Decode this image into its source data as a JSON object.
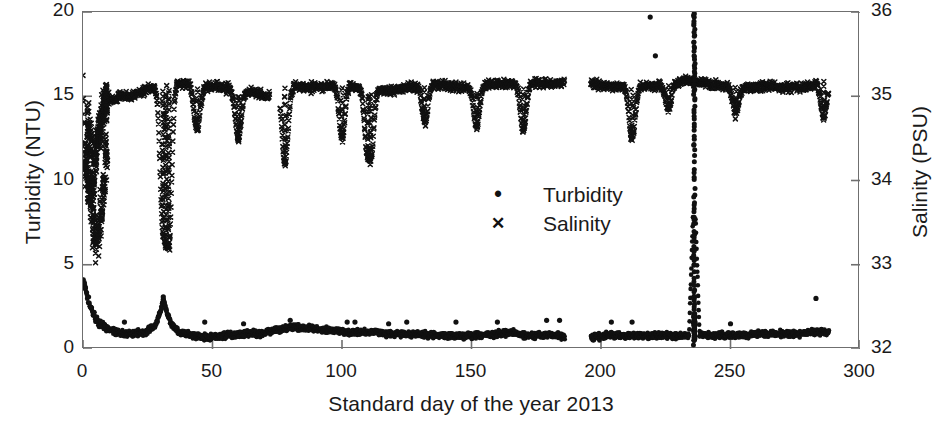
{
  "chart_data": {
    "type": "scatter",
    "title": "",
    "xlabel": "Standard  day of the  year 2013",
    "ylabel": "Turbidity (NTU)",
    "y2label": "Salinity (PSU)",
    "xlim": [
      0,
      300
    ],
    "ylim": [
      0,
      20
    ],
    "y2lim": [
      32,
      36
    ],
    "xticks": [
      "0",
      "50",
      "100",
      "150",
      "200",
      "250",
      "300"
    ],
    "xtick_values": [
      0,
      50,
      100,
      150,
      200,
      250,
      300
    ],
    "yticks": [
      "0",
      "5",
      "10",
      "15",
      "20"
    ],
    "ytick_values": [
      0,
      5,
      10,
      15,
      20
    ],
    "y2ticks": [
      "32",
      "33",
      "34",
      "35",
      "36"
    ],
    "y2tick_values": [
      32,
      33,
      34,
      35,
      36
    ],
    "grid": false,
    "frame": "box",
    "legend_position": "center",
    "marker_color": "#111111",
    "axis_color": "#6f6f6f",
    "background": "#ffffff",
    "series": [
      {
        "name": "Turbidity",
        "axis": "left",
        "marker": "dot",
        "units": "NTU",
        "description": "Dense near-baseline record 0.4-1.8 NTU across the year with an initial decay from ~4 NTU over days 0-8, a broad bump to ~3 NTU near day 31, scattered isolated points to ~1.5-2.5 NTU, a data gap at days 186-196, and a dramatic vertical excursion at day 236 spanning the full 0-20 NTU range.",
        "baseline_mean": 1.0,
        "peak_value": 20.0,
        "peak_day": 236,
        "gaps": [
          [
            186,
            196
          ]
        ],
        "data_start_day": 0,
        "data_end_day": 288,
        "anchors": [
          [
            0,
            3.9
          ],
          [
            1,
            3.6
          ],
          [
            2,
            3.0
          ],
          [
            3,
            2.5
          ],
          [
            4,
            2.1
          ],
          [
            5,
            1.8
          ],
          [
            6,
            1.6
          ],
          [
            8,
            1.4
          ],
          [
            10,
            1.2
          ],
          [
            13,
            1.0
          ],
          [
            16,
            0.9
          ],
          [
            20,
            0.9
          ],
          [
            24,
            1.0
          ],
          [
            28,
            1.4
          ],
          [
            30,
            2.3
          ],
          [
            31,
            3.0
          ],
          [
            32,
            2.4
          ],
          [
            34,
            1.5
          ],
          [
            37,
            1.0
          ],
          [
            42,
            0.8
          ],
          [
            48,
            0.7
          ],
          [
            55,
            0.8
          ],
          [
            62,
            0.9
          ],
          [
            68,
            0.9
          ],
          [
            74,
            1.1
          ],
          [
            80,
            1.3
          ],
          [
            88,
            1.2
          ],
          [
            96,
            1.1
          ],
          [
            104,
            1.0
          ],
          [
            112,
            1.0
          ],
          [
            120,
            0.9
          ],
          [
            128,
            0.9
          ],
          [
            136,
            0.8
          ],
          [
            144,
            0.8
          ],
          [
            152,
            0.8
          ],
          [
            160,
            0.9
          ],
          [
            166,
            1.0
          ],
          [
            170,
            0.8
          ],
          [
            176,
            0.8
          ],
          [
            182,
            0.8
          ],
          [
            196,
            0.7
          ],
          [
            204,
            0.8
          ],
          [
            212,
            0.8
          ],
          [
            220,
            0.8
          ],
          [
            228,
            0.8
          ],
          [
            234,
            0.8
          ],
          [
            236,
            10.0
          ],
          [
            238,
            0.9
          ],
          [
            244,
            0.8
          ],
          [
            252,
            0.8
          ],
          [
            260,
            0.9
          ],
          [
            268,
            0.9
          ],
          [
            276,
            0.9
          ],
          [
            282,
            1.0
          ],
          [
            288,
            1.0
          ]
        ],
        "outliers": [
          [
            16,
            1.6
          ],
          [
            31,
            3.1
          ],
          [
            47,
            1.6
          ],
          [
            62,
            1.5
          ],
          [
            80,
            1.7
          ],
          [
            102,
            1.6
          ],
          [
            105,
            1.6
          ],
          [
            118,
            1.5
          ],
          [
            125,
            1.6
          ],
          [
            144,
            1.6
          ],
          [
            160,
            1.6
          ],
          [
            179,
            1.7
          ],
          [
            184,
            1.7
          ],
          [
            204,
            1.6
          ],
          [
            212,
            1.6
          ],
          [
            219,
            19.7
          ],
          [
            221,
            17.4
          ],
          [
            236,
            19.9
          ],
          [
            250,
            1.5
          ],
          [
            283,
            3.0
          ]
        ]
      },
      {
        "name": "Salinity",
        "axis": "right",
        "marker": "cross",
        "units": "PSU",
        "description": "Dense upper band near 35.0-35.2 PSU for most of the year, punctuated by sharp downward dips to 34.5-34.8 PSU; highly scattered low and variable values from 33.2 to 35.2 PSU during the first ~10 days; isolated low outliers near days 30-33; data gaps at days 72-76 and 186-196.",
        "band_mean_psu": 35.1,
        "gaps": [
          [
            72,
            76
          ],
          [
            186,
            196
          ]
        ],
        "data_start_day": 0,
        "data_end_day": 288,
        "anchors_psu": [
          [
            0,
            35.15
          ],
          [
            1,
            34.2
          ],
          [
            2,
            33.9
          ],
          [
            3,
            34.0
          ],
          [
            4,
            33.8
          ],
          [
            5,
            34.4
          ],
          [
            6,
            34.5
          ],
          [
            7,
            34.8
          ],
          [
            8,
            34.9
          ],
          [
            10,
            34.95
          ],
          [
            14,
            35.0
          ],
          [
            18,
            35.0
          ],
          [
            22,
            35.05
          ],
          [
            26,
            35.1
          ],
          [
            29,
            35.1
          ],
          [
            33,
            35.12
          ],
          [
            37,
            35.15
          ],
          [
            41,
            35.15
          ],
          [
            45,
            35.1
          ],
          [
            50,
            35.12
          ],
          [
            55,
            35.1
          ],
          [
            60,
            35.08
          ],
          [
            66,
            35.05
          ],
          [
            71,
            35.0
          ],
          [
            78,
            35.08
          ],
          [
            82,
            35.12
          ],
          [
            88,
            35.1
          ],
          [
            94,
            35.12
          ],
          [
            100,
            35.15
          ],
          [
            106,
            35.1
          ],
          [
            112,
            35.08
          ],
          [
            118,
            35.05
          ],
          [
            124,
            35.1
          ],
          [
            130,
            35.12
          ],
          [
            136,
            35.15
          ],
          [
            142,
            35.12
          ],
          [
            148,
            35.1
          ],
          [
            154,
            35.12
          ],
          [
            160,
            35.15
          ],
          [
            166,
            35.15
          ],
          [
            172,
            35.15
          ],
          [
            180,
            35.15
          ],
          [
            196,
            35.15
          ],
          [
            204,
            35.12
          ],
          [
            212,
            35.1
          ],
          [
            220,
            35.12
          ],
          [
            228,
            35.15
          ],
          [
            234,
            35.18
          ],
          [
            240,
            35.15
          ],
          [
            248,
            35.12
          ],
          [
            256,
            35.1
          ],
          [
            264,
            35.12
          ],
          [
            272,
            35.1
          ],
          [
            280,
            35.12
          ],
          [
            286,
            35.2
          ],
          [
            288,
            35.15
          ]
        ],
        "dips_psu": [
          [
            31,
            33.5
          ],
          [
            32,
            33.3
          ],
          [
            33,
            33.2
          ],
          [
            44,
            34.6
          ],
          [
            60,
            34.5
          ],
          [
            78,
            34.2
          ],
          [
            100,
            34.5
          ],
          [
            110,
            34.3
          ],
          [
            111,
            34.25
          ],
          [
            132,
            34.7
          ],
          [
            152,
            34.65
          ],
          [
            170,
            34.6
          ],
          [
            212,
            34.5
          ],
          [
            226,
            34.85
          ],
          [
            252,
            34.8
          ],
          [
            286,
            34.75
          ]
        ],
        "scatter_early_psu": [
          [
            1,
            34.2
          ],
          [
            2,
            33.95
          ],
          [
            2,
            34.6
          ],
          [
            3,
            33.8
          ],
          [
            3,
            34.45
          ],
          [
            4,
            33.45
          ],
          [
            4,
            34.1
          ],
          [
            5,
            33.3
          ],
          [
            5,
            34.3
          ],
          [
            6,
            33.35
          ],
          [
            6,
            34.55
          ],
          [
            7,
            33.6
          ],
          [
            7,
            34.7
          ],
          [
            8,
            33.9
          ],
          [
            8,
            34.85
          ],
          [
            9,
            34.3
          ],
          [
            9,
            34.95
          ]
        ]
      }
    ]
  },
  "legend": {
    "items": [
      {
        "marker": "•",
        "label": "Turbidity"
      },
      {
        "marker": "✕",
        "label": "Salinity"
      }
    ]
  }
}
